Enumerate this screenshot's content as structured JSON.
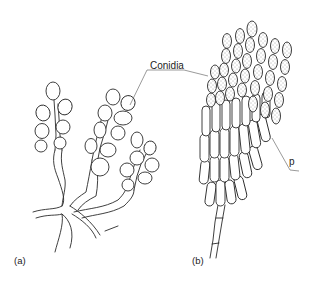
{
  "figure": {
    "labels": {
      "conidia": "Conidia",
      "p": "p",
      "panel_a": "(a)",
      "panel_b": "(b)"
    },
    "panels": [
      {
        "id": "a",
        "label": "(a)",
        "content": "branching hyphae bearing chains of round conidia"
      },
      {
        "id": "b",
        "label": "(b)",
        "content": "penicillate conidiophore with stippled elongated conidia in chains"
      }
    ],
    "colors": {
      "line": "#2a2a2a",
      "background": "#ffffff",
      "stipple": "#444444"
    }
  }
}
